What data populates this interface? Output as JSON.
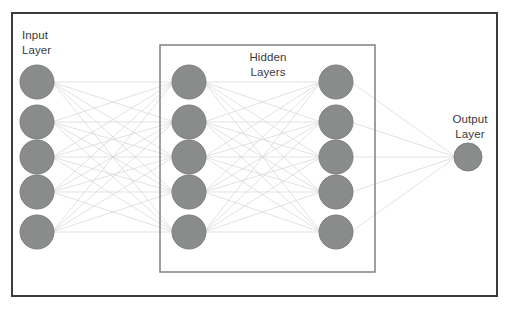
{
  "diagram": {
    "background_color": "#ffffff",
    "outer_frame": {
      "name": "network-frame",
      "x": 12,
      "y": 13,
      "width": 485,
      "height": 283,
      "stroke": "#3b3b3b",
      "stroke_width": 2,
      "fill": "none"
    },
    "hidden_box": {
      "name": "hidden-layers-box",
      "x": 160,
      "y": 45,
      "width": 215,
      "height": 227,
      "stroke": "#808080",
      "stroke_width": 1.5,
      "fill": "none"
    },
    "node_style": {
      "fill": "#8a8c8c",
      "stroke": "#7c7e7e",
      "stroke_width": 1
    },
    "edge_style": {
      "stroke": "#d4d6d6",
      "stroke_width": 0.7
    },
    "labels": {
      "input": "Input\nLayer",
      "hidden": "Hidden\nLayers",
      "output": "Output\nLayer"
    },
    "layers": [
      {
        "id": "input",
        "label": "Input Layer",
        "node_count": 5,
        "cx": 37,
        "r": 17,
        "cys": [
          82,
          122,
          157,
          192,
          232
        ]
      },
      {
        "id": "hidden-1",
        "label": "Hidden Layer 1",
        "node_count": 5,
        "cx": 189,
        "r": 17,
        "cys": [
          82,
          122,
          157,
          192,
          232
        ]
      },
      {
        "id": "hidden-2",
        "label": "Hidden Layer 2",
        "node_count": 5,
        "cx": 336,
        "r": 17,
        "cys": [
          82,
          122,
          157,
          192,
          232
        ]
      },
      {
        "id": "output",
        "label": "Output Layer",
        "node_count": 1,
        "cx": 468,
        "r": 14,
        "cys": [
          157
        ]
      }
    ],
    "connections": [
      {
        "from": "input",
        "to": "hidden-1",
        "type": "fully-connected"
      },
      {
        "from": "hidden-1",
        "to": "hidden-2",
        "type": "fully-connected"
      },
      {
        "from": "hidden-2",
        "to": "output",
        "type": "fully-connected"
      }
    ]
  }
}
